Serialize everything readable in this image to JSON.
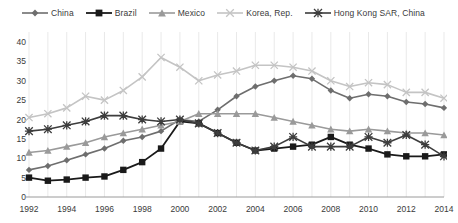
{
  "chart_data": {
    "type": "line",
    "title": "",
    "subtitle": "",
    "xlabel": "",
    "ylabel": "",
    "xlim": [
      1992,
      2014
    ],
    "ylim": [
      0,
      40
    ],
    "ytick_values": [
      0,
      5,
      10,
      15,
      20,
      25,
      30,
      35,
      40
    ],
    "ytick_labels": [
      "0",
      "5",
      "10",
      "15",
      "20",
      "25",
      "30",
      "35",
      "40"
    ],
    "xtick_values": [
      1992,
      1994,
      1996,
      1998,
      2000,
      2002,
      2004,
      2006,
      2008,
      2010,
      2012,
      2014
    ],
    "xtick_labels": [
      "1992",
      "1994",
      "1996",
      "1998",
      "2000",
      "2002",
      "2004",
      "2006",
      "2008",
      "2010",
      "2012",
      "2014"
    ],
    "x": [
      1992,
      1993,
      1994,
      1995,
      1996,
      1997,
      1998,
      1999,
      2000,
      2001,
      2002,
      2003,
      2004,
      2005,
      2006,
      2007,
      2008,
      2009,
      2010,
      2011,
      2012,
      2013,
      2014
    ],
    "grid": "vertical",
    "legend_position": "top",
    "series": [
      {
        "name": "China",
        "color": "#6e6e6e",
        "marker": "diamond",
        "line_width": 1.6,
        "values": [
          7.0,
          8.0,
          9.5,
          11.0,
          12.5,
          14.5,
          15.5,
          17.0,
          20.0,
          19.5,
          22.5,
          26.0,
          28.5,
          30.0,
          31.3,
          30.5,
          27.5,
          25.5,
          26.5,
          26.0,
          24.5,
          24.0,
          23.0
        ]
      },
      {
        "name": "Brazil",
        "color": "#1a1a1a",
        "marker": "square",
        "line_width": 1.8,
        "values": [
          5.0,
          4.2,
          4.5,
          5.0,
          5.3,
          7.0,
          9.0,
          12.5,
          19.5,
          19.0,
          16.5,
          14.0,
          12.0,
          12.5,
          13.0,
          13.5,
          15.5,
          13.5,
          12.5,
          11.0,
          10.5,
          10.5,
          11.0
        ]
      },
      {
        "name": "Mexico",
        "color": "#9a9a9a",
        "marker": "triangle",
        "line_width": 1.6,
        "values": [
          11.5,
          12.0,
          13.0,
          14.0,
          15.5,
          16.5,
          17.5,
          18.5,
          19.5,
          21.5,
          21.5,
          21.5,
          21.5,
          20.5,
          19.5,
          18.5,
          17.5,
          17.0,
          17.5,
          17.0,
          16.5,
          16.5,
          16.0
        ]
      },
      {
        "name": "Korea, Rep.",
        "color": "#c4c4c4",
        "marker": "cross",
        "line_width": 1.6,
        "values": [
          20.5,
          21.5,
          23.0,
          26.0,
          25.0,
          27.5,
          31.0,
          36.0,
          33.5,
          30.0,
          31.5,
          32.5,
          34.0,
          34.0,
          33.5,
          32.5,
          30.0,
          28.5,
          29.5,
          29.0,
          27.0,
          27.0,
          25.5
        ]
      },
      {
        "name": "Hong Kong SAR, China",
        "color": "#3d3d3d",
        "marker": "asterisk",
        "line_width": 1.6,
        "values": [
          17.0,
          17.5,
          18.5,
          19.5,
          21.0,
          21.0,
          20.0,
          19.5,
          20.0,
          19.0,
          16.5,
          14.0,
          12.0,
          13.0,
          15.5,
          13.0,
          13.0,
          13.0,
          15.5,
          14.0,
          16.0,
          13.5,
          10.5
        ]
      }
    ]
  }
}
